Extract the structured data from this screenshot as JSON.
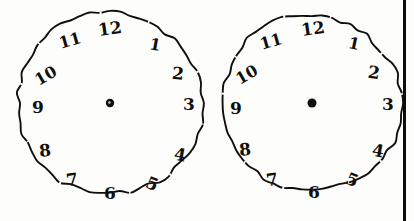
{
  "document": {
    "title": "Clock drawing test sheet",
    "background_color": "#fdfdfc",
    "ink_color": "#100f0d",
    "page_border_color": "#0d0d0d"
  },
  "page_border": {
    "name": "page-edge-rule",
    "orientation": "vertical",
    "x": 403,
    "width": 3
  },
  "clocks": [
    {
      "id": "clock-left",
      "label": "Left clock face",
      "center": {
        "x": 110,
        "y": 103
      },
      "radius": 92,
      "hands": [],
      "center_dot": {
        "radius": 4.2,
        "filled": true
      },
      "numerals": [
        {
          "value": "12",
          "x": 110,
          "y": 29,
          "size": 17,
          "rotate": -8
        },
        {
          "value": "1",
          "x": 155,
          "y": 45,
          "size": 16,
          "rotate": 10
        },
        {
          "value": "2",
          "x": 178,
          "y": 74,
          "size": 17,
          "rotate": 6
        },
        {
          "value": "3",
          "x": 189,
          "y": 104,
          "size": 17,
          "rotate": 0
        },
        {
          "value": "4",
          "x": 180,
          "y": 155,
          "size": 17,
          "rotate": 10
        },
        {
          "value": "5",
          "x": 152,
          "y": 184,
          "size": 17,
          "rotate": 22
        },
        {
          "value": "6",
          "x": 110,
          "y": 193,
          "size": 17,
          "rotate": 0
        },
        {
          "value": "7",
          "x": 72,
          "y": 180,
          "size": 17,
          "rotate": -8
        },
        {
          "value": "8",
          "x": 45,
          "y": 151,
          "size": 17,
          "rotate": -6
        },
        {
          "value": "9",
          "x": 38,
          "y": 107,
          "size": 17,
          "rotate": 0
        },
        {
          "value": "10",
          "x": 46,
          "y": 76,
          "size": 16,
          "rotate": -30
        },
        {
          "value": "11",
          "x": 70,
          "y": 41,
          "size": 16,
          "rotate": -16
        }
      ]
    },
    {
      "id": "clock-right",
      "label": "Right clock face",
      "center": {
        "x": 312,
        "y": 103
      },
      "radius": 89,
      "hands": [],
      "center_dot": {
        "radius": 4.5,
        "filled": true
      },
      "numerals": [
        {
          "value": "12",
          "x": 313,
          "y": 29,
          "size": 17,
          "rotate": -8
        },
        {
          "value": "1",
          "x": 354,
          "y": 44,
          "size": 16,
          "rotate": 12
        },
        {
          "value": "2",
          "x": 374,
          "y": 73,
          "size": 17,
          "rotate": 8
        },
        {
          "value": "3",
          "x": 388,
          "y": 104,
          "size": 17,
          "rotate": 0
        },
        {
          "value": "4",
          "x": 378,
          "y": 151,
          "size": 17,
          "rotate": 10
        },
        {
          "value": "5",
          "x": 352,
          "y": 180,
          "size": 17,
          "rotate": 22
        },
        {
          "value": "6",
          "x": 314,
          "y": 192,
          "size": 17,
          "rotate": 0
        },
        {
          "value": "7",
          "x": 272,
          "y": 180,
          "size": 17,
          "rotate": -8
        },
        {
          "value": "8",
          "x": 245,
          "y": 150,
          "size": 17,
          "rotate": -6
        },
        {
          "value": "9",
          "x": 236,
          "y": 108,
          "size": 17,
          "rotate": 0
        },
        {
          "value": "10",
          "x": 247,
          "y": 75,
          "size": 16,
          "rotate": -30
        },
        {
          "value": "11",
          "x": 271,
          "y": 42,
          "size": 16,
          "rotate": -16
        }
      ]
    }
  ]
}
